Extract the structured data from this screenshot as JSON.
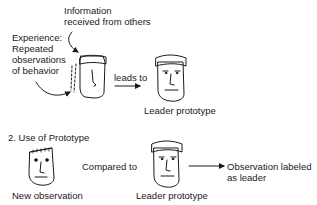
{
  "section1": {
    "info_label_line1": "Information",
    "info_label_line2": "received from others",
    "experience_line1": "Experience:",
    "experience_line2": "Repeated",
    "experience_line3": "observations",
    "experience_line4": "of behavior",
    "leads_to": "leads to",
    "leader_prototype": "Leader prototype"
  },
  "section2": {
    "heading": "2. Use of Prototype",
    "compared_to": "Compared to",
    "new_observation": "New observation",
    "leader_prototype": "Leader prototype",
    "result_line1": "Observation labeled",
    "result_line2": "as leader"
  }
}
